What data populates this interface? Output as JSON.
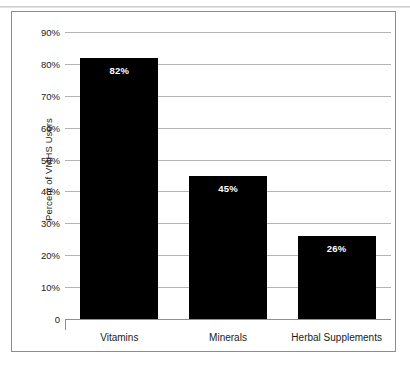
{
  "figure": {
    "border_color": "#8d8d8d",
    "background": "#ffffff"
  },
  "chart_data": {
    "type": "bar",
    "title": "",
    "subtitle": "",
    "xlabel": "",
    "ylabel": "Percent of VMHS Users",
    "categories": [
      "Vitamins",
      "Minerals",
      "Herbal Supplements"
    ],
    "values": [
      82,
      45,
      26
    ],
    "value_labels": [
      "82%",
      "45%",
      "26%"
    ],
    "ylim": [
      0,
      90
    ],
    "ytick_values": [
      0,
      10,
      20,
      30,
      40,
      50,
      60,
      70,
      80,
      90
    ],
    "ytick_labels": [
      "0",
      "10%",
      "20%",
      "30%",
      "40%",
      "50%",
      "60%",
      "70%",
      "80%",
      "90%"
    ],
    "grid": true,
    "grid_color": "#b3b3b3",
    "legend": "none",
    "bar_color": "#000000",
    "value_label_color": "#ffffff",
    "series": [
      {
        "name": "Percent of VMHS Users",
        "values": [
          82,
          45,
          26
        ]
      }
    ]
  }
}
